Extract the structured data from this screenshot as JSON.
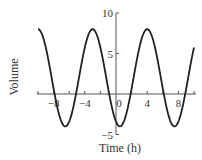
{
  "chart_data": {
    "type": "line",
    "title": "",
    "xlabel": "Time (h)",
    "ylabel": "Volume",
    "xlim": [
      -10,
      10
    ],
    "ylim": [
      -5,
      10
    ],
    "grid": false,
    "legend": null,
    "x_ticks": [
      -8,
      -4,
      0,
      4,
      8
    ],
    "x_tick_labels": [
      "−8",
      "−4",
      "0",
      "4",
      "8"
    ],
    "y_ticks": [
      -5,
      5,
      10
    ],
    "y_tick_labels": [
      "−5",
      "5",
      "10"
    ],
    "series": [
      {
        "name": "Volume",
        "description": "Sinusoid: V(t) = 2 + 6 cos(2π (t − 4) / 7); max 8, min −4, period 7 h",
        "x": [
          -10,
          -9,
          -8,
          -7,
          -6.5,
          -6,
          -5,
          -4,
          -3,
          -2,
          -1,
          0,
          0.5,
          1,
          2,
          3,
          4,
          5,
          6,
          7,
          7.5,
          8,
          9,
          10
        ],
        "values": [
          8.0,
          5.74,
          0.66,
          -3.41,
          -4.0,
          -3.41,
          0.66,
          5.74,
          8.0,
          5.74,
          0.66,
          -3.41,
          -4.0,
          -3.41,
          0.66,
          5.74,
          8.0,
          5.74,
          0.66,
          -3.41,
          -4.0,
          -3.41,
          0.66,
          5.74
        ]
      }
    ],
    "curve_params": {
      "midline": 2,
      "amplitude": 6,
      "period": 7,
      "peak_t": 4
    },
    "colors": {
      "curve": "#222222",
      "axis": "#555555",
      "text": "#333333"
    }
  }
}
